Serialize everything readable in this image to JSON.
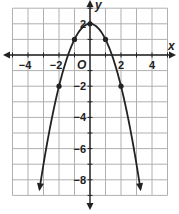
{
  "chart_data": {
    "type": "line",
    "title": "",
    "function": "y = -x^2 + 2",
    "xlabel": "x",
    "ylabel": "y",
    "origin_label": "O",
    "xlim": [
      -5,
      5
    ],
    "ylim": [
      -9,
      3
    ],
    "grid": true,
    "x_ticks": [
      -4,
      -2,
      2,
      4
    ],
    "x_tick_labels": [
      "−4",
      "−2",
      "2",
      "4"
    ],
    "y_ticks": [
      2,
      -2,
      -4,
      -6,
      -8
    ],
    "y_tick_labels": [
      "2",
      "−2",
      "−4",
      "−6",
      "−8"
    ],
    "marked_points": [
      {
        "x": -2,
        "y": -2
      },
      {
        "x": -1,
        "y": 1
      },
      {
        "x": 0,
        "y": 2
      },
      {
        "x": 1,
        "y": 1
      },
      {
        "x": 2,
        "y": -2
      }
    ],
    "curve_ends_with_arrows": true,
    "colors": {
      "curve": "#222222",
      "grid": "#b0b0b0",
      "axes": "#222222"
    }
  }
}
